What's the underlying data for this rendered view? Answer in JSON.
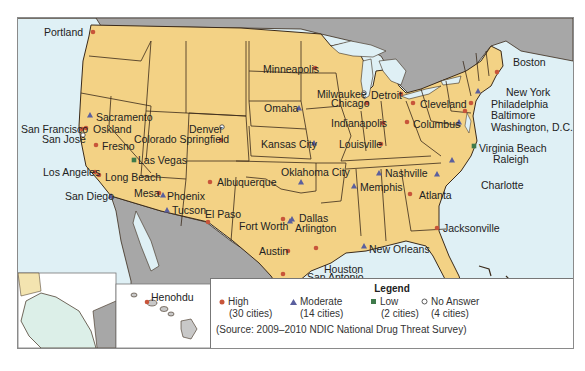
{
  "map": {
    "title": "Gang Threat by City (Contiguous US, Alaska, Hawaii)",
    "colors": {
      "land_us": "#f3d285",
      "land_other": "#a7a7a7",
      "water": "#dff0f5",
      "border": "#3a2a1a",
      "high": "#c8553a",
      "moderate": "#5a5f9e",
      "low": "#3f7a4b",
      "no_answer": "#ffffff"
    },
    "cities": [
      {
        "name": "Portland",
        "level": "high",
        "label_x": 43,
        "label_y": 25,
        "dot_x": 92,
        "dot_y": 31
      },
      {
        "name": "Sacramento",
        "level": "moderate",
        "label_x": 95,
        "label_y": 110,
        "dot_x": 89,
        "dot_y": 114
      },
      {
        "name": "San Francisco",
        "level": "high",
        "label_x": 20,
        "label_y": 122,
        "dot_x": 81,
        "dot_y": 128
      },
      {
        "name": "Oskland",
        "level": "high",
        "label_x": 92,
        "label_y": 122,
        "dot_x": 85,
        "dot_y": 127
      },
      {
        "name": "San Jose",
        "level": "no_answer",
        "label_x": 41,
        "label_y": 132,
        "dot_x": 82,
        "dot_y": 134
      },
      {
        "name": "Fresno",
        "level": "high",
        "label_x": 101,
        "label_y": 139,
        "dot_x": 95,
        "dot_y": 144
      },
      {
        "name": "Colorado Springfield",
        "level": "high",
        "label_x": 133,
        "label_y": 132,
        "dot_x": 220,
        "dot_y": 139
      },
      {
        "name": "Denver",
        "level": "no_answer",
        "label_x": 188,
        "label_y": 122,
        "dot_x": 221,
        "dot_y": 126
      },
      {
        "name": "Las Vegas",
        "level": "low",
        "label_x": 137,
        "label_y": 153,
        "dot_x": 133,
        "dot_y": 159
      },
      {
        "name": "Los Angeles",
        "level": "high",
        "label_x": 42,
        "label_y": 165,
        "dot_x": 94,
        "dot_y": 171
      },
      {
        "name": "Long Beach",
        "level": "high",
        "label_x": 104,
        "label_y": 170,
        "dot_x": 98,
        "dot_y": 174
      },
      {
        "name": "San Diego",
        "level": "moderate",
        "label_x": 64,
        "label_y": 189,
        "dot_x": 110,
        "dot_y": 195
      },
      {
        "name": "Mesa",
        "level": "high",
        "label_x": 133,
        "label_y": 186,
        "dot_x": 158,
        "dot_y": 192
      },
      {
        "name": "Phoenix",
        "level": "moderate",
        "label_x": 166,
        "label_y": 189,
        "dot_x": 162,
        "dot_y": 194
      },
      {
        "name": "Tucson",
        "level": "moderate",
        "label_x": 171,
        "label_y": 203,
        "dot_x": 166,
        "dot_y": 209
      },
      {
        "name": "El Paso",
        "level": "high",
        "label_x": 204,
        "label_y": 207,
        "dot_x": 207,
        "dot_y": 221
      },
      {
        "name": "Albuquerque",
        "level": "high",
        "label_x": 216,
        "label_y": 175,
        "dot_x": 209,
        "dot_y": 181
      },
      {
        "name": "Kansas City",
        "level": "moderate",
        "label_x": 260,
        "label_y": 137,
        "dot_x": 313,
        "dot_y": 142
      },
      {
        "name": "Oklahoma City",
        "level": "moderate",
        "label_x": 280,
        "label_y": 165,
        "dot_x": 300,
        "dot_y": 181
      },
      {
        "name": "Fort Worth",
        "level": "high",
        "label_x": 238,
        "label_y": 219,
        "dot_x": 282,
        "dot_y": 218
      },
      {
        "name": "Dallas",
        "level": "moderate",
        "label_x": 298,
        "label_y": 211,
        "dot_x": 291,
        "dot_y": 218
      },
      {
        "name": "Arlington",
        "level": "moderate",
        "label_x": 294,
        "label_y": 221,
        "dot_x": 289,
        "dot_y": 220
      },
      {
        "name": "Austin",
        "level": "high",
        "label_x": 258,
        "label_y": 244,
        "dot_x": 287,
        "dot_y": 250
      },
      {
        "name": "Houston",
        "level": "high",
        "label_x": 323,
        "label_y": 262,
        "dot_x": 315,
        "dot_y": 247
      },
      {
        "name": "San Antonio",
        "level": "high",
        "label_x": 306,
        "label_y": 270,
        "dot_x": 282,
        "dot_y": 273
      },
      {
        "name": "Minneapolis",
        "level": "high",
        "label_x": 262,
        "label_y": 62,
        "dot_x": 314,
        "dot_y": 67
      },
      {
        "name": "Omaha",
        "level": "moderate",
        "label_x": 263,
        "label_y": 101,
        "dot_x": 298,
        "dot_y": 107
      },
      {
        "name": "Milwaukee",
        "level": "no_answer",
        "label_x": 316,
        "label_y": 87,
        "dot_x": 363,
        "dot_y": 92
      },
      {
        "name": "Chicago",
        "level": "high",
        "label_x": 330,
        "label_y": 96,
        "dot_x": 366,
        "dot_y": 102
      },
      {
        "name": "Detroit",
        "level": "high",
        "label_x": 370,
        "label_y": 88,
        "dot_x": 400,
        "dot_y": 93
      },
      {
        "name": "Indianapolis",
        "level": "high",
        "label_x": 330,
        "label_y": 116,
        "dot_x": 382,
        "dot_y": 122
      },
      {
        "name": "Louisville",
        "level": "high",
        "label_x": 338,
        "label_y": 137,
        "dot_x": 380,
        "dot_y": 143
      },
      {
        "name": "Cleveland",
        "level": "high",
        "label_x": 419,
        "label_y": 97,
        "dot_x": 412,
        "dot_y": 102
      },
      {
        "name": "Columbus",
        "level": "high",
        "label_x": 412,
        "label_y": 117,
        "dot_x": 406,
        "dot_y": 121
      },
      {
        "name": "Boston",
        "level": "high",
        "label_x": 512,
        "label_y": 55,
        "dot_x": 496,
        "dot_y": 71
      },
      {
        "name": "New York",
        "level": "moderate",
        "label_x": 505,
        "label_y": 85,
        "dot_x": 477,
        "dot_y": 90
      },
      {
        "name": "Philadelphia",
        "level": "high",
        "label_x": 490,
        "label_y": 97,
        "dot_x": 470,
        "dot_y": 102
      },
      {
        "name": "Baltimore",
        "level": "high",
        "label_x": 490,
        "label_y": 108,
        "dot_x": 464,
        "dot_y": 110
      },
      {
        "name": "Washington, D.C.",
        "level": "moderate",
        "label_x": 490,
        "label_y": 120,
        "dot_x": 458,
        "dot_y": 121
      },
      {
        "name": "Virginia Beach",
        "level": "low",
        "label_x": 478,
        "label_y": 141,
        "dot_x": 473,
        "dot_y": 145
      },
      {
        "name": "Raleigh",
        "level": "moderate",
        "label_x": 492,
        "label_y": 152,
        "dot_x": 451,
        "dot_y": 159
      },
      {
        "name": "Charlotte",
        "level": "moderate",
        "label_x": 480,
        "label_y": 178,
        "dot_x": 436,
        "dot_y": 173
      },
      {
        "name": "Nashville",
        "level": "moderate",
        "label_x": 384,
        "label_y": 166,
        "dot_x": 378,
        "dot_y": 172
      },
      {
        "name": "Memphis",
        "level": "moderate",
        "label_x": 359,
        "label_y": 180,
        "dot_x": 353,
        "dot_y": 185
      },
      {
        "name": "Atlanta",
        "level": "high",
        "label_x": 418,
        "label_y": 188,
        "dot_x": 409,
        "dot_y": 193
      },
      {
        "name": "Jacksonville",
        "level": "high",
        "label_x": 442,
        "label_y": 221,
        "dot_x": 436,
        "dot_y": 227
      },
      {
        "name": "New Orleans",
        "level": "moderate",
        "label_x": 368,
        "label_y": 242,
        "dot_x": 363,
        "dot_y": 245
      },
      {
        "name": "Miami",
        "level": "high",
        "label_x": 459,
        "label_y": 276,
        "dot_x": 458,
        "dot_y": 282
      },
      {
        "name": "Henohdu",
        "level": "high",
        "label_x": 150,
        "label_y": 290,
        "dot_x": 146,
        "dot_y": 301
      }
    ]
  },
  "legend": {
    "title": "Legend",
    "items": [
      {
        "symbol": "circle-filled",
        "label": "High",
        "count": "(30 cities)"
      },
      {
        "symbol": "triangle",
        "label": "Moderate",
        "count": "(14 cities)"
      },
      {
        "symbol": "square",
        "label": "Low",
        "count": "(2 cities)"
      },
      {
        "symbol": "circle-open",
        "label": "No Answer",
        "count": "(4 cities)"
      }
    ],
    "source": "(Source: 2009–2010 NDIC National Drug Threat Survey)"
  }
}
